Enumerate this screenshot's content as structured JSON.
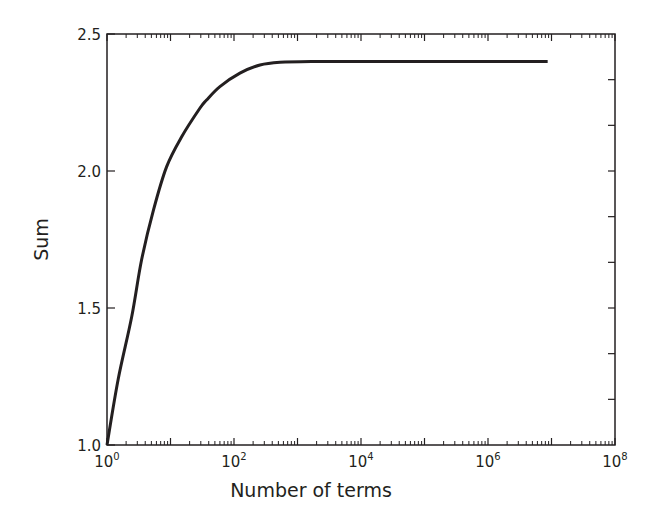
{
  "chart_data": {
    "type": "line",
    "title": "",
    "xlabel": "Number of terms",
    "ylabel": "Sum",
    "xscale": "log",
    "xlim": [
      1,
      100000000
    ],
    "ylim": [
      1.0,
      2.5
    ],
    "grid": false,
    "legend": "none",
    "x_ticks": [
      {
        "base": "10",
        "exp": "0",
        "value": 1
      },
      {
        "base": "10",
        "exp": "2",
        "value": 100
      },
      {
        "base": "10",
        "exp": "4",
        "value": 10000
      },
      {
        "base": "10",
        "exp": "6",
        "value": 1000000
      },
      {
        "base": "10",
        "exp": "8",
        "value": 100000000
      }
    ],
    "y_ticks": [
      {
        "label": "1.0",
        "value": 1.0
      },
      {
        "label": "1.5",
        "value": 1.5
      },
      {
        "label": "2.0",
        "value": 2.0
      },
      {
        "label": "2.5",
        "value": 2.5
      }
    ],
    "series": [
      {
        "name": "Sum",
        "color": "#231f20",
        "x": [
          1,
          1.5,
          2.45,
          3.5,
          5.4,
          8.7,
          15,
          29,
          37,
          60,
          124,
          257,
          530,
          1700,
          10000,
          100000,
          1000000,
          8700000
        ],
        "y": [
          1.0,
          1.24,
          1.468,
          1.675,
          1.858,
          2.016,
          2.125,
          2.229,
          2.259,
          2.308,
          2.357,
          2.387,
          2.397,
          2.4,
          2.4,
          2.4,
          2.4,
          2.4
        ]
      }
    ]
  }
}
